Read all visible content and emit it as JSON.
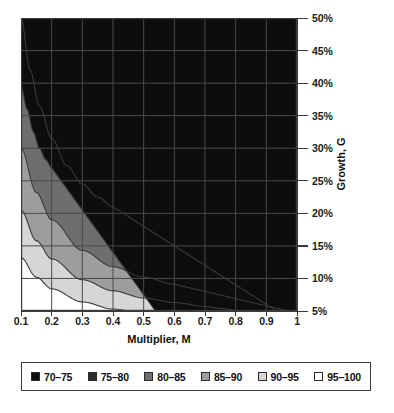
{
  "chart_data": {
    "type": "contour",
    "title": "",
    "xlabel": "Multiplier, M",
    "ylabel": "Growth, G",
    "xlim": [
      0.1,
      1.0
    ],
    "ylim": [
      0.05,
      0.5
    ],
    "grid": true,
    "x_ticks": [
      "0.1",
      "0.2",
      "0.3",
      "0.4",
      "0.5",
      "0.6",
      "0.7",
      "0.8",
      "0.9",
      "1"
    ],
    "x_tick_values": [
      0.1,
      0.2,
      0.3,
      0.4,
      0.5,
      0.6,
      0.7,
      0.8,
      0.9,
      1.0
    ],
    "y_ticks": [
      "5%",
      "10%",
      "15%",
      "20%",
      "25%",
      "30%",
      "35%",
      "40%",
      "45%",
      "50%"
    ],
    "y_tick_values": [
      5,
      10,
      15,
      20,
      25,
      30,
      35,
      40,
      45,
      50
    ],
    "y_axis_position": "right",
    "legend_position": "below",
    "bands": [
      {
        "label": "70–75",
        "range": [
          70,
          75
        ],
        "color": "#0d0d0d",
        "boundary_upper_note": "innermost region, upper-left corner only"
      },
      {
        "label": "75–80",
        "range": [
          75,
          80
        ],
        "color": "#2e2e2e",
        "boundary_upper_note": "band between 70-75 and 80-85 contours"
      },
      {
        "label": "80–85",
        "range": [
          80,
          85
        ],
        "color": "#6e6e6e",
        "boundary_upper_note": "band between 75-80 and 85-90 contours"
      },
      {
        "label": "85–90",
        "range": [
          85,
          90
        ],
        "color": "#9d9d9d",
        "boundary_upper_note": "band between 80-85 and 90-95 contours"
      },
      {
        "label": "90–95",
        "range": [
          90,
          95
        ],
        "color": "#d6d6d6",
        "boundary_upper_note": "band between 85-90 and 95-100 contours"
      },
      {
        "label": "95–100",
        "range": [
          95,
          100
        ],
        "color": "#ffffff",
        "boundary_upper_note": "outermost region, lower-right"
      }
    ],
    "contour_lines": [
      {
        "level": 75,
        "separates": [
          "70–75",
          "75–80"
        ],
        "points": [
          [
            0.1,
            0.395
          ],
          [
            0.12,
            0.36
          ],
          [
            0.14,
            0.325
          ],
          [
            0.16,
            0.3
          ],
          [
            0.18,
            0.283
          ],
          [
            0.2,
            0.27
          ]
        ]
      },
      {
        "level": 80,
        "separates": [
          "75–80",
          "80–85"
        ],
        "points": [
          [
            0.1,
            0.5
          ],
          [
            0.13,
            0.42
          ],
          [
            0.16,
            0.365
          ],
          [
            0.2,
            0.315
          ],
          [
            0.25,
            0.273
          ],
          [
            0.3,
            0.245
          ],
          [
            0.35,
            0.225
          ],
          [
            0.4,
            0.21
          ]
        ]
      },
      {
        "level": 85,
        "separates": [
          "80–85",
          "85–90"
        ],
        "points": [
          [
            0.1,
            0.3
          ],
          [
            0.15,
            0.232
          ],
          [
            0.2,
            0.19
          ],
          [
            0.3,
            0.143
          ],
          [
            0.4,
            0.118
          ],
          [
            0.5,
            0.102
          ],
          [
            0.6,
            0.091
          ]
        ]
      },
      {
        "level": 90,
        "separates": [
          "85–90",
          "90–95"
        ],
        "points": [
          [
            0.1,
            0.205
          ],
          [
            0.15,
            0.158
          ],
          [
            0.2,
            0.13
          ],
          [
            0.3,
            0.098
          ],
          [
            0.4,
            0.081
          ],
          [
            0.5,
            0.07
          ],
          [
            0.6,
            0.063
          ],
          [
            0.7,
            0.057
          ]
        ]
      },
      {
        "level": 95,
        "separates": [
          "90–95",
          "95–100"
        ],
        "points": [
          [
            0.1,
            0.132
          ],
          [
            0.15,
            0.102
          ],
          [
            0.2,
            0.084
          ],
          [
            0.3,
            0.064
          ],
          [
            0.4,
            0.053
          ],
          [
            0.5,
            0.046
          ],
          [
            0.6,
            0.041
          ]
        ]
      },
      {
        "level": 70,
        "separates": [
          "70–75",
          "corner"
        ],
        "points": [
          [
            0.1,
            0.062
          ],
          [
            0.2,
            0.05
          ]
        ]
      }
    ]
  },
  "legend": {
    "items": [
      {
        "label": "70–75",
        "color": "#0d0d0d"
      },
      {
        "label": "75–80",
        "color": "#2e2e2e"
      },
      {
        "label": "80–85",
        "color": "#6e6e6e"
      },
      {
        "label": "85–90",
        "color": "#9d9d9d"
      },
      {
        "label": "90–95",
        "color": "#d6d6d6"
      },
      {
        "label": "95–100",
        "color": "#ffffff"
      }
    ]
  },
  "axes": {
    "x_title": "Multiplier, M",
    "y_title": "Growth, G"
  },
  "colors": {
    "axis": "#3a3a3a",
    "grid": "#4a4a4a",
    "contour_line": "#3a3a3a",
    "text": "#111111",
    "background": "#ffffff"
  }
}
